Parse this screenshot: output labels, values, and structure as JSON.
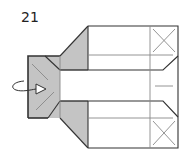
{
  "diagram": {
    "step_number": "21",
    "type": "origami folding step",
    "colors": {
      "paper_colored_side": "#c4c4c4",
      "paper_white_side": "#ffffff",
      "edge_line": "#333333",
      "crease_line": "#888888"
    },
    "symbols": [
      {
        "name": "turn-over-arrow",
        "meaning": "rotate/turn model over"
      },
      {
        "name": "x-marks",
        "meaning": "reference corner marks"
      }
    ]
  }
}
